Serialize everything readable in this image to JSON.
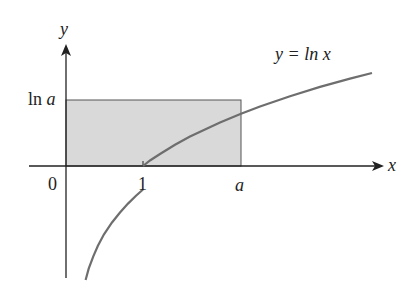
{
  "diagram": {
    "axis_labels": {
      "x": "x",
      "y": "y"
    },
    "tick_labels": {
      "origin": "0",
      "one": "1",
      "a": "a"
    },
    "y_tick_label": {
      "prefix": "ln ",
      "var": "a"
    },
    "curve_label": "y = ln x",
    "colors": {
      "curve": "#6e6e6e",
      "axes": "#222222",
      "shade": "#d9d9d9",
      "rect_edge": "#555555"
    }
  }
}
